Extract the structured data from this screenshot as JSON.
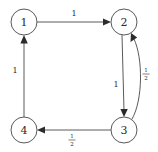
{
  "figure": {
    "kind": "directed-graph",
    "background_color": "#ffffff",
    "stroke_color": "#5a5a5a",
    "text_color": "#2b2b2b"
  },
  "nodes": [
    {
      "id": "1",
      "label": "1",
      "cx": 24,
      "cy": 22,
      "r": 13
    },
    {
      "id": "2",
      "label": "2",
      "cx": 124,
      "cy": 22,
      "r": 13
    },
    {
      "id": "3",
      "label": "3",
      "cx": 124,
      "cy": 130,
      "r": 13
    },
    {
      "id": "4",
      "label": "4",
      "cx": 24,
      "cy": 130,
      "r": 13
    }
  ],
  "edges": [
    {
      "id": "edge-1-2",
      "from": "1",
      "to": "2",
      "shape": "straight",
      "weight_label": "1",
      "weight_kind": "integer",
      "label_x": 74,
      "label_y": 13
    },
    {
      "id": "edge-2-3",
      "from": "2",
      "to": "3",
      "shape": "straight",
      "weight_label": "1",
      "weight_kind": "integer",
      "label_x": 116,
      "label_y": 84
    },
    {
      "id": "edge-3-2",
      "from": "3",
      "to": "2",
      "shape": "curved",
      "weight_label": "1/2",
      "weight_kind": "fraction",
      "numerator": "1",
      "denominator": "2",
      "label_x": 146,
      "label_y": 76
    },
    {
      "id": "edge-3-4",
      "from": "3",
      "to": "4",
      "shape": "straight",
      "weight_label": "1/2",
      "weight_kind": "fraction",
      "numerator": "1",
      "denominator": "2",
      "label_x": 72,
      "label_y": 140
    },
    {
      "id": "edge-4-1",
      "from": "4",
      "to": "1",
      "shape": "straight",
      "weight_label": "1",
      "weight_kind": "integer",
      "label_x": 15,
      "label_y": 70
    }
  ]
}
